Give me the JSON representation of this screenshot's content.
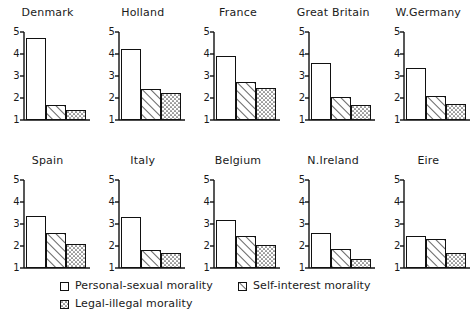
{
  "chart_data": {
    "type": "bar",
    "title": "",
    "xlabel": "",
    "ylabel": "",
    "ylim": [
      1,
      5
    ],
    "yticks": [
      5,
      4,
      3,
      2,
      1
    ],
    "grid": false,
    "legend_position": "bottom-left",
    "categories": [
      "Denmark",
      "Holland",
      "France",
      "Great Britain",
      "W.Germany",
      "Spain",
      "Italy",
      "Belgium",
      "N.Ireland",
      "Eire"
    ],
    "series": [
      {
        "name": "Personal-sexual morality",
        "fill": "plain",
        "values": [
          4.75,
          4.25,
          3.9,
          3.6,
          3.35,
          3.35,
          3.3,
          3.2,
          2.6,
          2.45
        ]
      },
      {
        "name": "Self-interest morality",
        "fill": "hatch",
        "values": [
          1.7,
          2.4,
          2.75,
          2.05,
          2.1,
          2.6,
          1.8,
          2.45,
          1.85,
          2.3
        ]
      },
      {
        "name": "Legal-illegal morality",
        "fill": "dots",
        "values": [
          1.45,
          2.25,
          2.45,
          1.7,
          1.75,
          2.1,
          1.7,
          2.05,
          1.4,
          1.7
        ]
      }
    ],
    "panels": [
      {
        "title": "Denmark",
        "values": [
          4.75,
          1.7,
          1.45
        ]
      },
      {
        "title": "Holland",
        "values": [
          4.25,
          2.4,
          2.25
        ]
      },
      {
        "title": "France",
        "values": [
          3.9,
          2.75,
          2.45
        ]
      },
      {
        "title": "Great Britain",
        "values": [
          3.6,
          2.05,
          1.7
        ]
      },
      {
        "title": "W.Germany",
        "values": [
          3.35,
          2.1,
          1.75
        ]
      },
      {
        "title": "Spain",
        "values": [
          3.35,
          2.6,
          2.1
        ]
      },
      {
        "title": "Italy",
        "values": [
          3.3,
          1.8,
          1.7
        ]
      },
      {
        "title": "Belgium",
        "values": [
          3.2,
          2.45,
          2.05
        ]
      },
      {
        "title": "N.Ireland",
        "values": [
          2.6,
          1.85,
          1.4
        ]
      },
      {
        "title": "Eire",
        "values": [
          2.45,
          2.3,
          1.7
        ]
      }
    ]
  },
  "legend": {
    "lines": [
      [
        {
          "label": "Personal-sexual morality",
          "fill": "plain"
        },
        {
          "label": "Self-interest morality",
          "fill": "hatch"
        }
      ],
      [
        {
          "label": "Legal-illegal morality",
          "fill": "dots"
        }
      ]
    ]
  },
  "colors": {
    "ink": "#111111",
    "background": "#ffffff",
    "bar_plain": "#ffffff",
    "bar_hatch": "#ffffff",
    "bar_dots": "#ffffff"
  }
}
